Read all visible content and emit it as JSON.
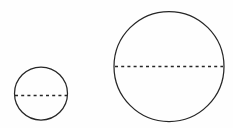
{
  "diagram": {
    "background_color": "#fefefe",
    "stroke_color": "#262626",
    "canvas": {
      "width": 233,
      "height": 128
    },
    "shape_count": "2",
    "shapes": [
      {
        "name": "small-circle",
        "label": "small circle",
        "cx": 41,
        "cy": 93.5,
        "r": 26.5,
        "diameter": 53,
        "stroke_color": "#262626",
        "stroke_width": 1.25,
        "fill": "none",
        "diameter_line": {
          "name": "small-circle-diameter",
          "label": "dashed diameter",
          "x1": 15,
          "x2": 67,
          "y": 95.5,
          "style": "dashed",
          "dash_pattern": "3 3.2",
          "stroke_color": "#262626",
          "stroke_width": 1.6
        }
      },
      {
        "name": "large-circle",
        "label": "large circle",
        "cx": 169,
        "cy": 66.5,
        "r": 55,
        "diameter": 110,
        "stroke_color": "#262626",
        "stroke_width": 1.25,
        "fill": "none",
        "diameter_line": {
          "name": "large-circle-diameter",
          "label": "dashed diameter",
          "x1": 115,
          "x2": 223,
          "y": 66.5,
          "style": "dashed",
          "dash_pattern": "3 3.2",
          "stroke_color": "#262626",
          "stroke_width": 1.6
        }
      }
    ]
  }
}
